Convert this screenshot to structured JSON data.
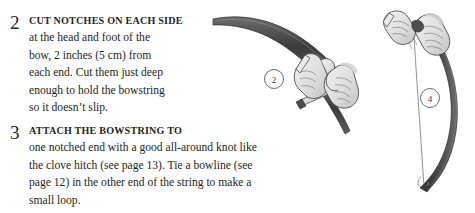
{
  "page": {
    "background_color": "#ffffff",
    "text_color": "#231f20"
  },
  "steps": [
    {
      "number": "2",
      "lead": "Cut notches on each side",
      "lines": [
        "at the head and foot of the",
        "bow, 2 inches (5 cm) from",
        "each end. Cut them just deep",
        "enough to hold the bowstring",
        "so it doesn’t slip."
      ],
      "full_text": "Cut notches on each side at the head and foot of the bow, 2 inches (5 cm) from each end. Cut them just deep enough to hold the bowstring so it doesn’t slip."
    },
    {
      "number": "3",
      "lead": "Attach the bowstring to",
      "lines": [
        "one notched end with a good all-around knot like",
        "the clove hitch (see page 13). Tie a bowline (see",
        "page 12) in the other end of the string to make a",
        "small loop."
      ],
      "full_text": "Attach the bowstring to one notched end with a good all-around knot like the clove hitch (see page 13). Tie a bowline (see page 12) in the other end of the string to make a small loop."
    }
  ],
  "illustrations": [
    {
      "name": "cutting-notch-illustration",
      "callout_label": "2",
      "description": "Two hands holding a bow stave and a knife cutting a notch near the bow tip",
      "bow_color": "#4a4a4a",
      "hand_fill": "#e0e0e0",
      "hand_stroke": "#3c3c3c"
    },
    {
      "name": "stringing-bow-illustration",
      "callout_label": "4",
      "description": "Two hands tying the bowstring onto the top notch of a strung bow",
      "bow_color": "#3f3f3f",
      "string_color": "#8a8a8a",
      "hand_fill": "#e3e3e3",
      "hand_stroke": "#3c3c3c"
    }
  ],
  "colors": {
    "ink": "#231f20",
    "bow_dark": "#414141",
    "bow_mid": "#6e6e6e",
    "hand_fill": "#e2e2e2",
    "hand_shadow": "#b9b9b9",
    "outline": "#3a3a3a",
    "callout_stroke": "#5a5a5a"
  }
}
